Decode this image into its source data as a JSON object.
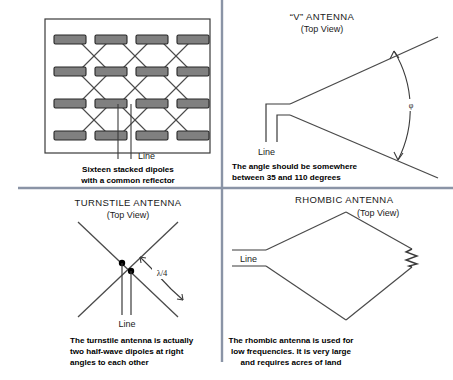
{
  "figure": {
    "kind": "antenna-types-diagram",
    "background": "#ffffff",
    "divider_color": "#8a94a6",
    "ink_color": "#333333",
    "caption_color": "#000000",
    "dipole_fill": "#808080",
    "dipole_stroke": "#262626"
  },
  "quadrants": {
    "stacked_dipoles": {
      "line_label": "Line",
      "caption_line1": "Sixteen stacked dipoles",
      "caption_line2": "with a common reflector",
      "rows": 4,
      "cols": 4,
      "total_dipoles": 16
    },
    "v_antenna": {
      "title": "“V” ANTENNA",
      "subtitle": "(Top View)",
      "line_label": "Line",
      "angle_symbol": "φ",
      "caption_line1": "The angle should be somewhere",
      "caption_line2": "between 35 and 110 degrees",
      "angle_min_degrees": 35,
      "angle_max_degrees": 110
    },
    "turnstile_antenna": {
      "title": "TURNSTILE ANTENNA",
      "subtitle": "(Top View)",
      "line_label": "Line",
      "dimension_label": "λ/4",
      "caption_line1": "The turnstile antenna is actually",
      "caption_line2": "two half-wave dipoles at right",
      "caption_line3": "angles to each other"
    },
    "rhombic_antenna": {
      "title": "RHOMBIC ANTENNA",
      "subtitle": "(Top View)",
      "line_label": "Line",
      "caption_line1": "The rhombic antenna is used for",
      "caption_line2": "low frequencies.  It is very large",
      "caption_line3": "and requires acres of land"
    }
  }
}
